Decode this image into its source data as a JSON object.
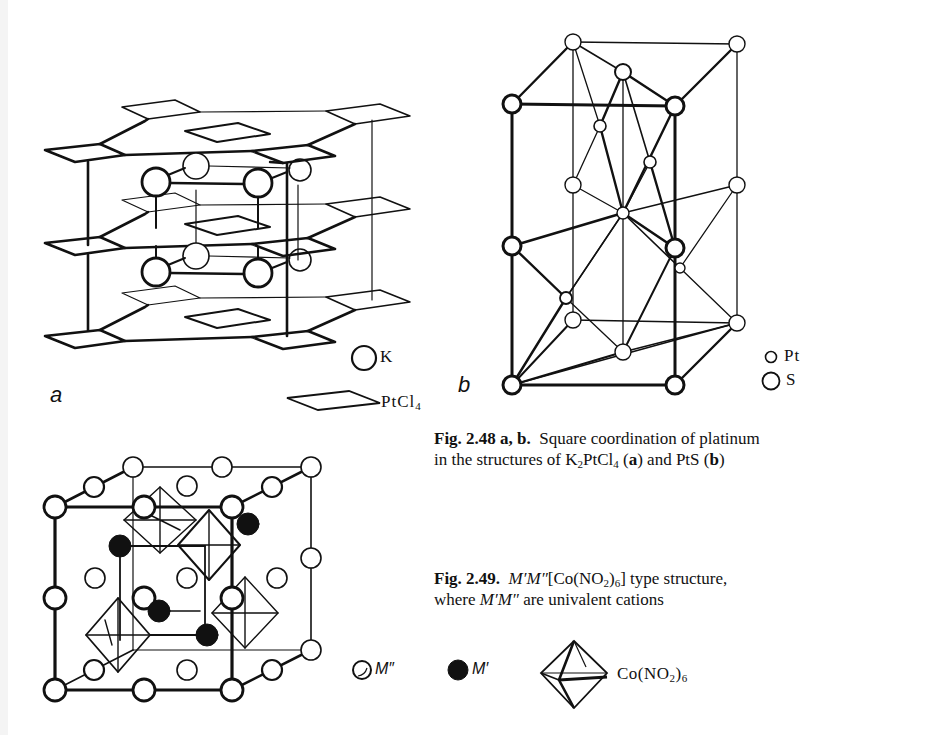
{
  "figure_2_48": {
    "panel_a": {
      "label": "a",
      "legend": [
        {
          "symbol": "circle-large",
          "text": "K"
        },
        {
          "symbol": "square-plane",
          "text_main": "PtCl",
          "text_sub": "4"
        }
      ]
    },
    "panel_b": {
      "label": "b",
      "legend": [
        {
          "symbol": "circle-small",
          "text": "Pt"
        },
        {
          "symbol": "circle-large",
          "text": "S"
        }
      ]
    },
    "caption": {
      "number": "Fig. 2.48",
      "parts": "a, b.",
      "line1": "Square coordination of platinum",
      "line2_prefix": "in the structures of K",
      "line2_sub1": "2",
      "line2_mid": "PtCl",
      "line2_sub2": "4",
      "label_a_open": " (",
      "label_a": "a",
      "label_a_close": ") and PtS (",
      "label_b": "b",
      "label_b_close": ")"
    }
  },
  "figure_2_49": {
    "legend": [
      {
        "symbol": "open-sphere",
        "text": "M″"
      },
      {
        "symbol": "filled-sphere",
        "text": "M′"
      },
      {
        "symbol": "octahedron",
        "text_main": "Co(NO",
        "text_sub1": "2",
        "text_mid": ")",
        "text_sub2": "6"
      }
    ],
    "caption": {
      "number": "Fig.  2.49.",
      "formula_ital": "M′M″",
      "formula_rest": "[Co(NO",
      "formula_sub1": "2",
      "formula_mid": ")",
      "formula_sub2": "6",
      "formula_end": "]  type  structure,",
      "line2_prefix": "where ",
      "line2_ital": "M′M″",
      "line2_rest": "  are univalent cations"
    }
  }
}
